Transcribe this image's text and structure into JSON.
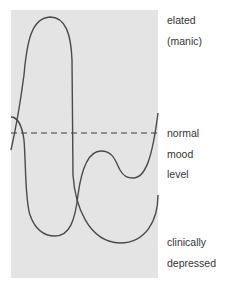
{
  "diagram": {
    "title": "",
    "panel_color": "#e4e4e4",
    "curve_color": "#4a4a4a",
    "baseline": {
      "name": "normal mood level",
      "style": "dashed",
      "color": "#3a3a3a"
    },
    "labels": {
      "top_line1": "elated",
      "top_line2": "(manic)",
      "mid_line1": "normal",
      "mid_line2": "mood",
      "mid_line3": "level",
      "bottom_line1": "clinically",
      "bottom_line2": "depressed"
    },
    "curves": [
      {
        "name": "mood-curve-manic-depressive",
        "description": "rises sharply to elated peak, then falls deep into depression and recovers"
      },
      {
        "name": "mood-curve-depressive",
        "description": "drops into depression, recovers just below normal, dips again and rises above normal"
      }
    ]
  }
}
